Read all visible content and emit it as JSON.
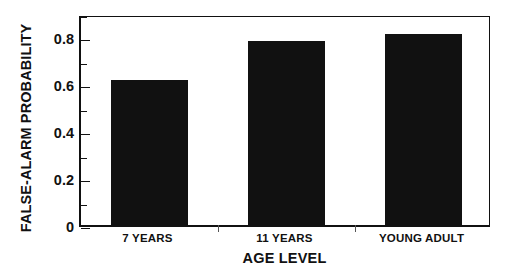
{
  "chart_data": {
    "type": "bar",
    "title": "",
    "subtitle": "",
    "xlabel": "AGE LEVEL",
    "ylabel": "FALSE-ALARM PROBABILITY",
    "categories": [
      "7 YEARS",
      "11 YEARS",
      "YOUNG ADULT"
    ],
    "values": [
      0.62,
      0.785,
      0.815
    ],
    "series": [
      {
        "name": "False-alarm probability",
        "values": [
          0.62,
          0.785,
          0.815
        ]
      }
    ],
    "ylim": [
      0,
      0.9
    ],
    "xlim": [
      0,
      3
    ],
    "y_major_ticks": [
      0,
      0.2,
      0.4,
      0.6,
      0.8
    ],
    "y_tick_labels": [
      "0",
      "0.2",
      "0.4",
      "0.6",
      "0.8"
    ],
    "y_minor_ticks": [
      0.1,
      0.3,
      0.5,
      0.7,
      0.9
    ],
    "grid": false,
    "legend": null,
    "legend_position": "none",
    "annotations": [],
    "bar_color": "#111111",
    "axis_color": "#111111",
    "background_color": "#ffffff",
    "bar_width_fraction": 0.56
  }
}
